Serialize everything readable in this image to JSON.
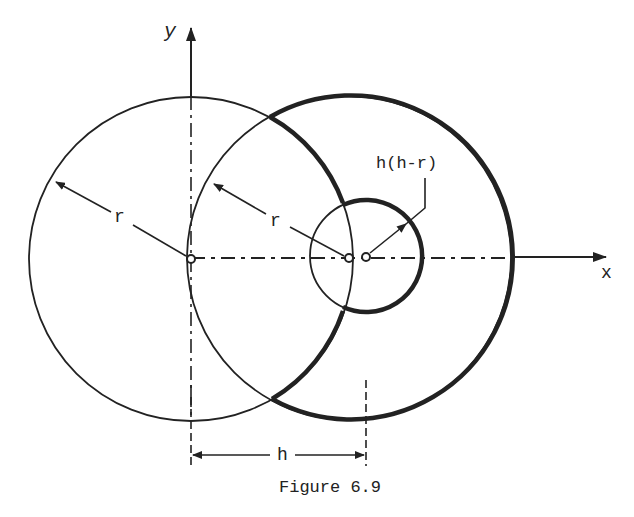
{
  "figure": {
    "caption": "Figure 6.9",
    "axes": {
      "x_label": "x",
      "y_label": "y"
    },
    "labels": {
      "left_radius": "r",
      "right_radius": "r",
      "small_radius": "h(h-r)",
      "offset": "h"
    },
    "geometry": {
      "origin": [
        191,
        259
      ],
      "left_circle": {
        "cx": 191,
        "cy": 259,
        "r": 162
      },
      "right_circle": {
        "cx": 349,
        "cy": 258,
        "r": 162
      },
      "small_circle": {
        "cx": 366,
        "cy": 256,
        "r": 56
      },
      "offset_h_px": 175
    },
    "colors": {
      "ink": "#222222",
      "background": "#ffffff"
    }
  }
}
